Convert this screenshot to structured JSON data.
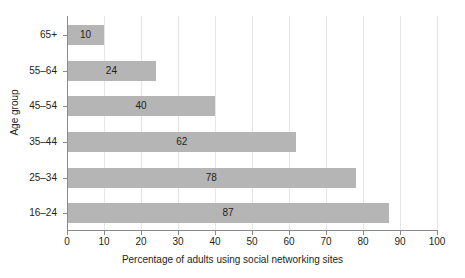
{
  "chart_data": {
    "type": "bar",
    "orientation": "horizontal",
    "title": "",
    "subtitle": "",
    "xlabel": "Percentage of adults using social networking sites",
    "ylabel": "Age group",
    "categories": [
      "65+",
      "55–64",
      "45–54",
      "35–44",
      "25–34",
      "16–24"
    ],
    "values": [
      10,
      24,
      40,
      62,
      78,
      87
    ],
    "data_labels": [
      "10",
      "24",
      "40",
      "62",
      "78",
      "87"
    ],
    "xlim": [
      0,
      100
    ],
    "x_ticks": [
      0,
      10,
      20,
      30,
      40,
      50,
      60,
      70,
      80,
      90,
      100
    ],
    "x_tick_labels": [
      "0",
      "10",
      "20",
      "30",
      "40",
      "50",
      "60",
      "70",
      "80",
      "90",
      "100"
    ],
    "grid": "vertical",
    "legend": "none",
    "colors": {
      "bar_fill": "#b5b5b5",
      "gridline": "#e6e6e6",
      "axis_line": "#8a8a8a",
      "text": "#231f20",
      "background": "#ffffff"
    }
  }
}
